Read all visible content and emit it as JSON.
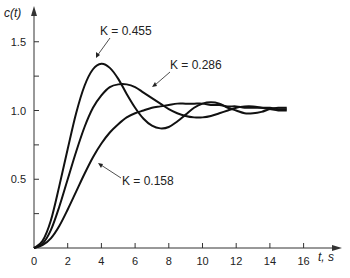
{
  "chart_data": {
    "type": "line",
    "title": "",
    "xlabel": "t, s",
    "ylabel": "c(t)",
    "xlim": [
      0,
      17
    ],
    "ylim": [
      0,
      1.6
    ],
    "x_ticks": [
      "0",
      "2",
      "4",
      "6",
      "8",
      "10",
      "12",
      "14",
      "16"
    ],
    "y_ticks": [
      "0.5",
      "1.0",
      "1.5"
    ],
    "grid": false,
    "series": [
      {
        "name": "K = 0.455",
        "x": [
          0,
          0.5,
          1,
          1.5,
          2,
          2.5,
          3,
          3.5,
          4,
          4.5,
          5,
          5.5,
          6,
          6.5,
          7,
          7.5,
          8,
          8.5,
          9,
          9.5,
          10,
          10.5,
          11,
          11.5,
          12,
          12.5,
          13,
          13.5,
          14,
          14.5,
          15
        ],
        "y": [
          0,
          0.05,
          0.2,
          0.45,
          0.72,
          0.98,
          1.18,
          1.3,
          1.34,
          1.31,
          1.23,
          1.12,
          1.02,
          0.94,
          0.89,
          0.87,
          0.88,
          0.92,
          0.97,
          1.02,
          1.05,
          1.06,
          1.05,
          1.02,
          1.0,
          0.98,
          0.98,
          0.99,
          1.01,
          1.02,
          1.02
        ]
      },
      {
        "name": "K = 0.286",
        "x": [
          0,
          0.5,
          1,
          1.5,
          2,
          2.5,
          3,
          3.5,
          4,
          4.5,
          5,
          5.5,
          6,
          6.5,
          7,
          7.5,
          8,
          8.5,
          9,
          9.5,
          10,
          10.5,
          11,
          11.5,
          12,
          12.5,
          13,
          13.5,
          14,
          14.5,
          15
        ],
        "y": [
          0,
          0.03,
          0.13,
          0.3,
          0.5,
          0.7,
          0.88,
          1.02,
          1.11,
          1.17,
          1.19,
          1.19,
          1.17,
          1.13,
          1.09,
          1.05,
          1.01,
          0.98,
          0.96,
          0.95,
          0.95,
          0.96,
          0.98,
          1.0,
          1.02,
          1.03,
          1.03,
          1.02,
          1.01,
          1.0,
          1.0
        ]
      },
      {
        "name": "K = 0.158",
        "x": [
          0,
          0.5,
          1,
          1.5,
          2,
          2.5,
          3,
          3.5,
          4,
          4.5,
          5,
          5.5,
          6,
          6.5,
          7,
          7.5,
          8,
          8.5,
          9,
          9.5,
          10,
          10.5,
          11,
          11.5,
          12,
          12.5,
          13,
          13.5,
          14,
          14.5,
          15
        ],
        "y": [
          0,
          0.02,
          0.07,
          0.16,
          0.28,
          0.41,
          0.54,
          0.66,
          0.76,
          0.84,
          0.9,
          0.95,
          0.98,
          1.0,
          1.02,
          1.03,
          1.04,
          1.05,
          1.05,
          1.05,
          1.05,
          1.04,
          1.04,
          1.03,
          1.03,
          1.02,
          1.02,
          1.02,
          1.02,
          1.01,
          1.01
        ]
      }
    ],
    "annotations": [
      {
        "text": "K = 0.455",
        "x": 4.3,
        "y": 1.34
      },
      {
        "text": "K = 0.286",
        "x": 6.3,
        "y": 1.17
      },
      {
        "text": "K = 0.158",
        "x": 2.6,
        "y": 0.7
      }
    ]
  },
  "labels": {
    "ylabel": "c(t)",
    "xlabel": "t, s",
    "k1": "K = 0.455",
    "k2": "K = 0.286",
    "k3": "K = 0.158"
  }
}
